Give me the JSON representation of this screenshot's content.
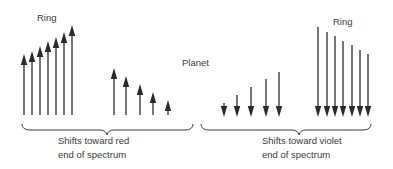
{
  "labels": {
    "ring_left": "Ring",
    "planet": "Planet",
    "ring_right": "Ring"
  },
  "captions": {
    "red_line1": "Shifts toward red",
    "red_line2": "end of spectrum",
    "violet_line1": "Shifts toward violet",
    "violet_line2": "end of spectrum"
  },
  "groups": {
    "ring_left": {
      "direction": "up",
      "base_y": 115,
      "arrows": [
        {
          "x": 24,
          "tip": 54
        },
        {
          "x": 32,
          "tip": 51
        },
        {
          "x": 40,
          "tip": 46
        },
        {
          "x": 48,
          "tip": 41
        },
        {
          "x": 56,
          "tip": 37
        },
        {
          "x": 64,
          "tip": 32
        },
        {
          "x": 72,
          "tip": 25
        }
      ]
    },
    "planet_left": {
      "direction": "up",
      "base_y": 115,
      "arrows": [
        {
          "x": 114,
          "tip": 68
        },
        {
          "x": 126,
          "tip": 76
        },
        {
          "x": 140,
          "tip": 84
        },
        {
          "x": 153,
          "tip": 92
        },
        {
          "x": 168,
          "tip": 100
        }
      ]
    },
    "planet_right": {
      "direction": "down",
      "tip_y": 117,
      "arrows": [
        {
          "x": 224,
          "top": 103
        },
        {
          "x": 237,
          "top": 95
        },
        {
          "x": 251,
          "top": 87
        },
        {
          "x": 266,
          "top": 79
        },
        {
          "x": 279,
          "top": 72
        }
      ]
    },
    "ring_right": {
      "direction": "down",
      "tip_y": 117,
      "arrows": [
        {
          "x": 318,
          "top": 27
        },
        {
          "x": 327,
          "top": 32
        },
        {
          "x": 335,
          "top": 36
        },
        {
          "x": 343,
          "top": 41
        },
        {
          "x": 352,
          "top": 45
        },
        {
          "x": 360,
          "top": 50
        },
        {
          "x": 368,
          "top": 54
        }
      ]
    }
  },
  "colors": {
    "arrow": "#2a2a2a",
    "text": "#3a3a3a",
    "background": "#ffffff"
  }
}
